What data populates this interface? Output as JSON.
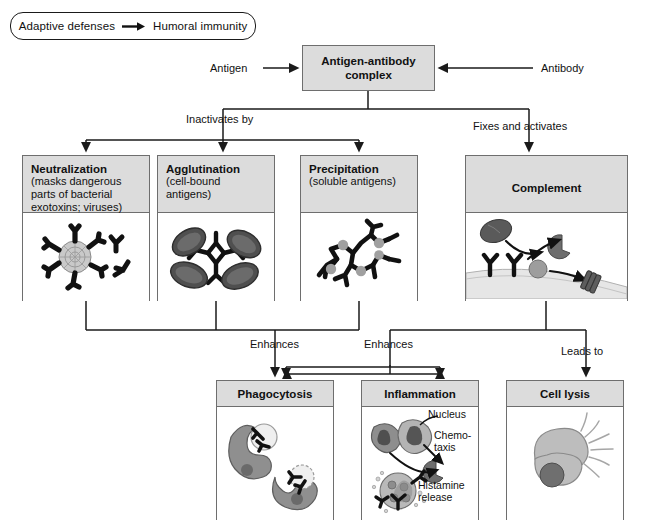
{
  "header": {
    "left": "Adaptive defenses",
    "arrow": "→",
    "right": "Humoral immunity"
  },
  "top": {
    "title": "Antigen-antibody complex",
    "input_left_label": "Antigen",
    "input_right_label": "Antibody"
  },
  "branch_labels": {
    "inactivates": "Inactivates by",
    "fixes": "Fixes and activates",
    "enhances_left": "Enhances",
    "enhances_right": "Enhances",
    "leads_to": "Leads to"
  },
  "mechanisms": [
    {
      "title": "Neutralization",
      "subtitle": "(masks dangerous parts of bacterial exotoxins; viruses)"
    },
    {
      "title": "Agglutination",
      "subtitle": "(cell-bound antigens)"
    },
    {
      "title": "Precipitation",
      "subtitle": "(soluble antigens)"
    },
    {
      "title": "Complement",
      "subtitle": ""
    }
  ],
  "outcomes": [
    {
      "title": "Phagocytosis"
    },
    {
      "title": "Inflammation"
    },
    {
      "title": "Cell lysis"
    }
  ],
  "inflammation_annotations": {
    "nucleus": "Nucleus",
    "chemotaxis_line1": "Chemo-",
    "chemotaxis_line2": "taxis",
    "histamine_line1": "Histamine",
    "histamine_line2": "release"
  },
  "colors": {
    "box_fill": "#ffffff",
    "header_fill": "#dcdcdc",
    "box_border": "#6e6e6e",
    "line": "#1a1a1a",
    "text": "#111111",
    "cell_gray": "#8c8c8c",
    "cell_dark": "#4a4a4a",
    "cell_light": "#bdbdbd"
  }
}
